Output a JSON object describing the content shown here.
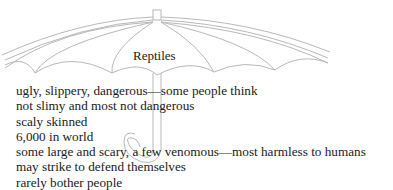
{
  "diagram": {
    "type": "umbrella-organizer",
    "title": "Reptiles",
    "details": [
      "ugly, slippery, dangerous—some people think",
      "not slimy and most not dangerous",
      "scaly skinned",
      "6,000 in world",
      "some large and scary, a few venomous—most harmless to humans",
      "may strike to defend themselves",
      "rarely bother people"
    ],
    "colors": {
      "outline": "#b5b5b5",
      "text": "#1a1a1a"
    }
  }
}
